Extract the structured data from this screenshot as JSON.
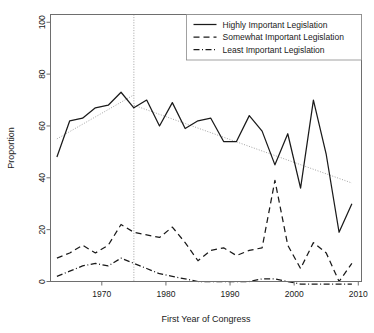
{
  "chart_data": {
    "type": "line",
    "title": "",
    "xlabel": "First Year of Congress",
    "ylabel": "Proportion",
    "xlim": [
      1962,
      2010.5
    ],
    "ylim": [
      0,
      103
    ],
    "xticks": [
      1970,
      1980,
      1990,
      2000,
      2010
    ],
    "xtick_labels": [
      "1970",
      "1980",
      "1990",
      "2000",
      "2010"
    ],
    "yticks": [
      0,
      20,
      40,
      60,
      80,
      100
    ],
    "ytick_labels": [
      "0",
      "20",
      "40",
      "60",
      "80",
      "100"
    ],
    "grid": false,
    "legend_position": "top-right",
    "x": [
      1963,
      1965,
      1967,
      1969,
      1971,
      1973,
      1975,
      1977,
      1979,
      1981,
      1983,
      1985,
      1987,
      1989,
      1991,
      1993,
      1995,
      1997,
      1999,
      2001,
      2003,
      2005,
      2007,
      2009
    ],
    "series": [
      {
        "name": "Highly Important Legislation",
        "style": "solid",
        "values": [
          48,
          62,
          63,
          67,
          68,
          73,
          67,
          70,
          60,
          69,
          59,
          62,
          63,
          54,
          54,
          64,
          58,
          45,
          57,
          36,
          70,
          49,
          19,
          30
        ]
      },
      {
        "name": "Somewhat Important Legislation",
        "style": "dashed",
        "values": [
          9,
          11,
          14,
          11,
          14,
          22,
          19,
          18,
          17,
          21,
          15,
          8,
          12,
          13,
          10,
          12,
          13,
          39,
          14,
          5,
          15,
          11,
          0,
          7
        ]
      },
      {
        "name": "Least Important Legislation",
        "style": "dashdot",
        "values": [
          2,
          4,
          6,
          7,
          6,
          9,
          7,
          5,
          3,
          2,
          1,
          0,
          0,
          0,
          0,
          0,
          1,
          1,
          0,
          -1,
          -1,
          -1,
          -1,
          -1
        ]
      }
    ],
    "annotations": [
      {
        "type": "vertical-reference-line",
        "x": 1975,
        "style": "dotted"
      },
      {
        "type": "trend-line",
        "label": "pre-1975 trend",
        "style": "dotted",
        "x0": 1963,
        "y0": 55,
        "x1": 1975,
        "y1": 72
      },
      {
        "type": "trend-line",
        "label": "post-1975 trend",
        "style": "dotted",
        "x0": 1975,
        "y0": 68,
        "x1": 2009,
        "y1": 38
      }
    ],
    "colors": {
      "series": "#1a1a1a",
      "trend": "#9a9a9a",
      "frame": "#6e6e6e",
      "background": "#ffffff"
    }
  }
}
